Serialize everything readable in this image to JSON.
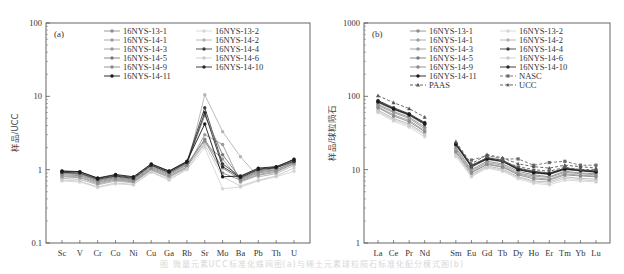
{
  "caption": "图 微量元素UCC标准化蛛网图(a)与稀土元素球粒陨石标准化配分模式图(b)",
  "chart_data": [
    {
      "type": "line",
      "panel_label": "(a)",
      "title": "",
      "xlabel": "",
      "ylabel": "样品/UCC",
      "yscale": "log",
      "ylim": [
        0.1,
        100
      ],
      "yticks": [
        "0.1",
        "1",
        "10",
        "100"
      ],
      "grid": false,
      "legend_position": "upper-center, two columns",
      "categories": [
        "Sc",
        "V",
        "Cr",
        "Co",
        "Ni",
        "Cu",
        "Ga",
        "Rb",
        "Sr",
        "Mo",
        "Ba",
        "Pb",
        "Th",
        "U"
      ],
      "series": [
        {
          "name": "16NYS-13-1",
          "color": "#8c8c8c",
          "dash": "",
          "marker": "circle",
          "values": [
            0.88,
            0.86,
            0.7,
            0.78,
            0.72,
            1.08,
            0.88,
            1.18,
            2.6,
            1.05,
            0.74,
            0.93,
            1.0,
            1.28
          ]
        },
        {
          "name": "16NYS-13-2",
          "color": "#d6d6d6",
          "dash": "",
          "marker": "circle",
          "values": [
            0.7,
            0.68,
            0.57,
            0.64,
            0.62,
            0.92,
            0.72,
            1.0,
            2.0,
            0.55,
            0.58,
            0.7,
            0.8,
            0.95
          ]
        },
        {
          "name": "16NYS-14-1",
          "color": "#a0a0a0",
          "dash": "",
          "marker": "circle",
          "values": [
            0.82,
            0.8,
            0.66,
            0.74,
            0.68,
            1.02,
            0.82,
            1.1,
            2.3,
            1.4,
            0.7,
            0.86,
            0.95,
            1.2
          ]
        },
        {
          "name": "16NYS-14-2",
          "color": "#b4b4b4",
          "dash": "",
          "marker": "circle",
          "values": [
            0.76,
            0.74,
            0.62,
            0.7,
            0.66,
            0.98,
            0.78,
            1.05,
            10.5,
            3.3,
            1.5,
            0.8,
            0.88,
            1.15
          ]
        },
        {
          "name": "16NYS-14-3",
          "color": "#9a9a9a",
          "dash": "",
          "marker": "circle",
          "values": [
            0.8,
            0.78,
            0.64,
            0.72,
            0.68,
            1.0,
            0.8,
            1.08,
            3.0,
            2.2,
            0.68,
            0.84,
            0.92,
            1.22
          ]
        },
        {
          "name": "16NYS-14-4",
          "color": "#404040",
          "dash": "",
          "marker": "circle",
          "values": [
            0.95,
            0.93,
            0.76,
            0.84,
            0.78,
            1.18,
            0.95,
            1.28,
            7.0,
            1.2,
            0.8,
            1.02,
            1.08,
            1.35
          ]
        },
        {
          "name": "16NYS-14-5",
          "color": "#7a7a7a",
          "dash": "",
          "marker": "circle",
          "values": [
            0.9,
            0.88,
            0.72,
            0.8,
            0.74,
            1.12,
            0.9,
            1.22,
            5.5,
            1.6,
            0.76,
            0.96,
            1.04,
            1.4
          ]
        },
        {
          "name": "16NYS-14-6",
          "color": "#cccccc",
          "dash": "",
          "marker": "circle",
          "values": [
            0.72,
            0.7,
            0.58,
            0.66,
            0.63,
            0.94,
            0.74,
            1.02,
            2.2,
            0.8,
            0.6,
            0.72,
            0.82,
            1.05
          ]
        },
        {
          "name": "16NYS-14-9",
          "color": "#8a8a8a",
          "dash": "",
          "marker": "circle",
          "values": [
            0.85,
            0.83,
            0.68,
            0.76,
            0.7,
            1.05,
            0.85,
            1.15,
            2.5,
            0.9,
            0.72,
            0.9,
            0.98,
            1.25
          ]
        },
        {
          "name": "16NYS-14-10",
          "color": "#2a2a2a",
          "dash": "",
          "marker": "circle",
          "values": [
            0.92,
            0.9,
            0.74,
            0.82,
            0.76,
            1.15,
            0.92,
            1.25,
            6.0,
            1.1,
            0.78,
            1.0,
            1.06,
            1.3
          ]
        },
        {
          "name": "16NYS-14-11",
          "color": "#1a1a1a",
          "dash": "",
          "marker": "circle",
          "values": [
            0.96,
            0.94,
            0.77,
            0.86,
            0.8,
            1.2,
            0.96,
            1.3,
            4.2,
            0.8,
            0.82,
            1.05,
            1.1,
            1.38
          ]
        }
      ]
    },
    {
      "type": "line",
      "panel_label": "(b)",
      "title": "",
      "xlabel": "",
      "ylabel": "样品/球粒陨石",
      "yscale": "log",
      "ylim": [
        1,
        1000
      ],
      "yticks": [
        "1",
        "10",
        "100",
        "1000"
      ],
      "grid": false,
      "legend_position": "upper-center, two columns",
      "categories": [
        "La",
        "Ce",
        "Pr",
        "Nd",
        "",
        "Sm",
        "Eu",
        "Gd",
        "Tb",
        "Dy",
        "Ho",
        "Er",
        "Tm",
        "Yb",
        "Lu"
      ],
      "tick_labels": [
        "La",
        "Ce",
        "Pr",
        "Nd",
        "",
        "Sm",
        "Eu",
        "Gd",
        "Tb",
        "Dy",
        "Ho",
        "Er",
        "Tm",
        "Yb",
        "Lu"
      ],
      "series": [
        {
          "name": "16NYS-13-1",
          "color": "#8c8c8c",
          "dash": "",
          "marker": "circle",
          "values": [
            78,
            62,
            52,
            38,
            null,
            20,
            10.0,
            13.0,
            12.0,
            9.5,
            8.5,
            8.0,
            9.5,
            9.0,
            8.8
          ]
        },
        {
          "name": "16NYS-13-2",
          "color": "#d6d6d6",
          "dash": "",
          "marker": "circle",
          "values": [
            60,
            46,
            38,
            28,
            null,
            15,
            8.0,
            10.5,
            9.5,
            7.5,
            6.5,
            6.2,
            7.2,
            7.0,
            6.8
          ]
        },
        {
          "name": "16NYS-14-1",
          "color": "#a0a0a0",
          "dash": "",
          "marker": "circle",
          "values": [
            72,
            56,
            47,
            34,
            null,
            18,
            9.2,
            12.0,
            11.0,
            8.8,
            7.8,
            7.4,
            8.8,
            8.4,
            8.2
          ]
        },
        {
          "name": "16NYS-14-2",
          "color": "#b4b4b4",
          "dash": "",
          "marker": "circle",
          "values": [
            65,
            50,
            42,
            31,
            null,
            16.5,
            8.5,
            11.2,
            10.2,
            8.0,
            7.0,
            6.8,
            8.0,
            7.6,
            7.4
          ]
        },
        {
          "name": "16NYS-14-3",
          "color": "#9a9a9a",
          "dash": "",
          "marker": "circle",
          "values": [
            75,
            60,
            50,
            36,
            null,
            19,
            9.6,
            12.5,
            11.5,
            9.0,
            8.2,
            7.8,
            9.2,
            8.8,
            8.5
          ]
        },
        {
          "name": "16NYS-14-4",
          "color": "#404040",
          "dash": "",
          "marker": "circle",
          "values": [
            88,
            70,
            58,
            44,
            null,
            23,
            11.5,
            14.5,
            13.5,
            10.5,
            9.5,
            9.0,
            10.5,
            10.0,
            9.6
          ]
        },
        {
          "name": "16NYS-14-5",
          "color": "#7a7a7a",
          "dash": "",
          "marker": "circle",
          "values": [
            82,
            66,
            55,
            41,
            null,
            21.5,
            10.8,
            13.8,
            12.8,
            10.0,
            9.0,
            8.6,
            10.0,
            9.6,
            9.2
          ]
        },
        {
          "name": "16NYS-14-6",
          "color": "#cccccc",
          "dash": "",
          "marker": "circle",
          "values": [
            62,
            48,
            40,
            30,
            null,
            16,
            8.2,
            10.8,
            9.8,
            7.8,
            6.8,
            6.5,
            7.6,
            7.3,
            7.0
          ]
        },
        {
          "name": "16NYS-14-9",
          "color": "#8a8a8a",
          "dash": "",
          "marker": "circle",
          "values": [
            70,
            54,
            45,
            33,
            null,
            17.5,
            9.0,
            11.8,
            10.8,
            8.5,
            7.5,
            7.2,
            8.5,
            8.2,
            8.0
          ]
        },
        {
          "name": "16NYS-14-10",
          "color": "#2a2a2a",
          "dash": "",
          "marker": "circle",
          "values": [
            86,
            68,
            57,
            43,
            null,
            22.5,
            11.2,
            14.2,
            13.2,
            10.2,
            9.3,
            8.8,
            10.3,
            9.8,
            9.4
          ]
        },
        {
          "name": "16NYS-14-11",
          "color": "#1a1a1a",
          "dash": "",
          "marker": "circle",
          "values": [
            84,
            67,
            56,
            42,
            null,
            22,
            11.0,
            14.0,
            13.0,
            10.0,
            9.1,
            8.7,
            10.2,
            9.7,
            9.3
          ]
        },
        {
          "name": "NASC",
          "color": "#6a6a6a",
          "dash": "3,2",
          "marker": "square",
          "values": [
            null,
            null,
            null,
            null,
            null,
            null,
            13.5,
            15.5,
            14.0,
            14.0,
            11.5,
            12.5,
            13.0,
            11.5,
            11.5
          ]
        },
        {
          "name": "PAAS",
          "color": "#555555",
          "dash": "3,2",
          "marker": "triangle",
          "values": [
            102,
            82,
            68,
            52,
            null,
            24,
            12.0,
            16.0,
            14.5,
            12.0,
            11.0,
            10.5,
            11.5,
            11.0,
            10.5
          ]
        },
        {
          "name": "UCC",
          "color": "#5a5a5a",
          "dash": "3,2",
          "marker": "star",
          "values": [
            null,
            null,
            null,
            null,
            null,
            null,
            11.0,
            14.8,
            13.0,
            11.0,
            10.0,
            9.5,
            10.8,
            10.0,
            10.0
          ]
        }
      ]
    }
  ]
}
